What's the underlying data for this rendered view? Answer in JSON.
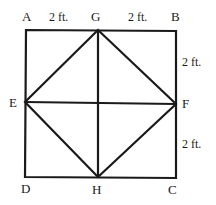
{
  "diagram": {
    "points": {
      "A": {
        "label": "A"
      },
      "B": {
        "label": "B"
      },
      "C": {
        "label": "C"
      },
      "D": {
        "label": "D"
      },
      "E": {
        "label": "E"
      },
      "F": {
        "label": "F"
      },
      "G": {
        "label": "G"
      },
      "H": {
        "label": "H"
      }
    },
    "dimensions": {
      "AG": "2 ft.",
      "GB": "2 ft.",
      "BF": "2 ft.",
      "FC": "2 ft."
    },
    "segments": [
      "AB",
      "BC",
      "CD",
      "DA",
      "GH",
      "EF",
      "GF",
      "FH",
      "HE",
      "EG"
    ],
    "colors": {
      "stroke": "#1a1a1a",
      "background": "#ffffff"
    }
  }
}
